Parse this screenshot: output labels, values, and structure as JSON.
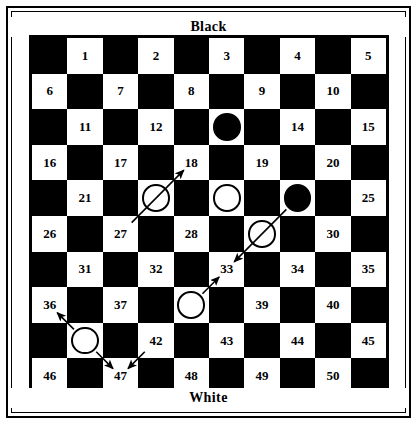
{
  "diagram": {
    "title_top": "Black",
    "title_bottom": "White",
    "board_type": "international-draughts-10x10",
    "numbered_squares": 50,
    "ink_color": "#000000",
    "paper_color": "#ffffff"
  },
  "board": {
    "rows": 10,
    "cols": 10,
    "square_numbers": [
      [
        null,
        1,
        null,
        2,
        null,
        3,
        null,
        4,
        null,
        5
      ],
      [
        6,
        null,
        7,
        null,
        8,
        null,
        9,
        null,
        10,
        null
      ],
      [
        null,
        11,
        null,
        12,
        null,
        13,
        null,
        14,
        null,
        15
      ],
      [
        16,
        null,
        17,
        null,
        18,
        null,
        19,
        null,
        20,
        null
      ],
      [
        null,
        21,
        null,
        22,
        null,
        23,
        null,
        24,
        null,
        25
      ],
      [
        26,
        null,
        27,
        null,
        28,
        null,
        29,
        null,
        30,
        null
      ],
      [
        null,
        31,
        null,
        32,
        null,
        33,
        null,
        34,
        null,
        35
      ],
      [
        36,
        null,
        37,
        null,
        38,
        null,
        39,
        null,
        40,
        null
      ],
      [
        null,
        41,
        null,
        42,
        null,
        43,
        null,
        44,
        null,
        45
      ],
      [
        46,
        null,
        47,
        null,
        48,
        null,
        49,
        null,
        50,
        null
      ]
    ],
    "visible_numbers": [
      1,
      2,
      3,
      4,
      5,
      6,
      7,
      8,
      9,
      10,
      11,
      12,
      14,
      15,
      16,
      17,
      18,
      19,
      20,
      21,
      25,
      26,
      27,
      28,
      30,
      31,
      32,
      33,
      34,
      35,
      36,
      37,
      39,
      40,
      42,
      43,
      44,
      45,
      46,
      47,
      48,
      49,
      50
    ],
    "hidden_numbers_under_pieces": [
      13,
      22,
      23,
      24,
      29,
      38,
      41
    ]
  },
  "pieces": [
    {
      "square": 13,
      "color": "black"
    },
    {
      "square": 22,
      "color": "white"
    },
    {
      "square": 23,
      "color": "white"
    },
    {
      "square": 24,
      "color": "black"
    },
    {
      "square": 29,
      "color": "white"
    },
    {
      "square": 38,
      "color": "white"
    },
    {
      "square": 41,
      "color": "white"
    }
  ],
  "arrows": [
    {
      "from": 27,
      "to": 18,
      "via": 22,
      "head": "to"
    },
    {
      "from": 24,
      "to": 33,
      "via": 29,
      "head": "to"
    },
    {
      "from": 38,
      "to": 33,
      "head": "to"
    },
    {
      "from": 41,
      "to": 36,
      "head": "to"
    },
    {
      "from": 42,
      "to": 47,
      "head": "to"
    },
    {
      "from": 41,
      "to": 47,
      "head": "to"
    }
  ]
}
